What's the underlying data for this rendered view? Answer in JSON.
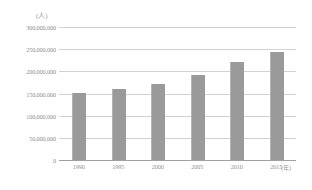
{
  "chart_data": {
    "type": "bar",
    "title": "",
    "xlabel": "(年)",
    "ylabel": "(人)",
    "categories": [
      "1990",
      "1995",
      "2000",
      "2005",
      "2010",
      "2015"
    ],
    "values": [
      152000000,
      161000000,
      172000000,
      192000000,
      222000000,
      244000000
    ],
    "ylim": [
      0,
      300000000
    ],
    "ytick_labels": [
      "300,000,000",
      "250,000,000",
      "200,000,000",
      "150,000,000",
      "100,000,000",
      "50,000,000",
      "0"
    ],
    "ytick_values": [
      300000000,
      250000000,
      200000000,
      150000000,
      100000000,
      50000000,
      0
    ],
    "grid": true,
    "legend": "none",
    "bar_color": "#9a9a9a",
    "grid_color": "#d2d2d2",
    "axis_color": "#a0a0a0",
    "text_color": "#8f8f8f",
    "background": "#ffffff"
  }
}
